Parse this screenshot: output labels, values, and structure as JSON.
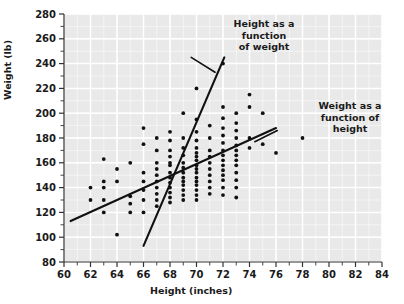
{
  "figure": {
    "background": "#ffffff",
    "plot_bg": "#e9e9e9",
    "grid_color": "#ffffff",
    "point_color": "#111111",
    "line_color": "#111111"
  },
  "axes": {
    "x_label": "Height (inches)",
    "y_label": "Weight (lb)",
    "x_ticks": [
      60,
      62,
      64,
      66,
      68,
      70,
      72,
      74,
      76,
      78,
      80,
      82,
      84
    ],
    "y_ticks": [
      80,
      100,
      120,
      140,
      160,
      180,
      200,
      220,
      240,
      260,
      280
    ],
    "x_minor_step": 1,
    "y_minor_step": 10
  },
  "annotations": [
    {
      "name": "height-as-function-of-weight-label",
      "text": "Height as a\nfunction\nof weight"
    },
    {
      "name": "weight-as-function-of-height-label",
      "text": "Weight as a\nfunction of\nheight"
    }
  ],
  "chart_data": {
    "type": "scatter",
    "title": "",
    "xlabel": "Height (inches)",
    "ylabel": "Weight (lb)",
    "xlim": [
      60,
      84
    ],
    "ylim": [
      80,
      280
    ],
    "xtick_step": 2,
    "ytick_step": 20,
    "grid": true,
    "legend": "none",
    "points": [
      [
        62,
        140
      ],
      [
        62,
        130
      ],
      [
        63,
        163
      ],
      [
        63,
        145
      ],
      [
        63,
        140
      ],
      [
        63,
        130
      ],
      [
        63,
        120
      ],
      [
        64,
        145
      ],
      [
        64,
        155
      ],
      [
        64,
        102
      ],
      [
        65,
        160
      ],
      [
        65,
        133
      ],
      [
        65,
        127
      ],
      [
        65,
        120
      ],
      [
        66,
        175
      ],
      [
        66,
        188
      ],
      [
        66,
        152
      ],
      [
        66,
        145
      ],
      [
        66,
        138
      ],
      [
        66,
        130
      ],
      [
        66,
        120
      ],
      [
        67,
        180
      ],
      [
        67,
        170
      ],
      [
        67,
        160
      ],
      [
        67,
        155
      ],
      [
        67,
        150
      ],
      [
        67,
        145
      ],
      [
        67,
        140
      ],
      [
        67,
        135
      ],
      [
        67,
        130
      ],
      [
        67,
        125
      ],
      [
        68,
        185
      ],
      [
        68,
        178
      ],
      [
        68,
        170
      ],
      [
        68,
        165
      ],
      [
        68,
        160
      ],
      [
        68,
        158
      ],
      [
        68,
        152
      ],
      [
        68,
        148
      ],
      [
        68,
        144
      ],
      [
        68,
        140
      ],
      [
        68,
        136
      ],
      [
        68,
        132
      ],
      [
        68,
        128
      ],
      [
        69,
        200
      ],
      [
        69,
        180
      ],
      [
        69,
        172
      ],
      [
        69,
        166
      ],
      [
        69,
        160
      ],
      [
        69,
        156
      ],
      [
        69,
        152
      ],
      [
        69,
        148
      ],
      [
        69,
        145
      ],
      [
        69,
        142
      ],
      [
        69,
        138
      ],
      [
        69,
        134
      ],
      [
        69,
        130
      ],
      [
        70,
        220
      ],
      [
        70,
        195
      ],
      [
        70,
        185
      ],
      [
        70,
        178
      ],
      [
        70,
        172
      ],
      [
        70,
        168
      ],
      [
        70,
        165
      ],
      [
        70,
        162
      ],
      [
        70,
        158
      ],
      [
        70,
        155
      ],
      [
        70,
        152
      ],
      [
        70,
        148
      ],
      [
        70,
        145
      ],
      [
        70,
        142
      ],
      [
        70,
        138
      ],
      [
        70,
        134
      ],
      [
        70,
        130
      ],
      [
        71,
        190
      ],
      [
        71,
        180
      ],
      [
        71,
        170
      ],
      [
        71,
        165
      ],
      [
        71,
        160
      ],
      [
        71,
        155
      ],
      [
        71,
        150
      ],
      [
        71,
        145
      ],
      [
        71,
        140
      ],
      [
        71,
        135
      ],
      [
        72,
        240
      ],
      [
        72,
        205
      ],
      [
        72,
        196
      ],
      [
        72,
        188
      ],
      [
        72,
        182
      ],
      [
        72,
        176
      ],
      [
        72,
        170
      ],
      [
        72,
        166
      ],
      [
        72,
        162
      ],
      [
        72,
        158
      ],
      [
        72,
        154
      ],
      [
        72,
        150
      ],
      [
        72,
        146
      ],
      [
        72,
        140
      ],
      [
        72,
        134
      ],
      [
        73,
        200
      ],
      [
        73,
        192
      ],
      [
        73,
        186
      ],
      [
        73,
        180
      ],
      [
        73,
        174
      ],
      [
        73,
        170
      ],
      [
        73,
        166
      ],
      [
        73,
        162
      ],
      [
        73,
        158
      ],
      [
        73,
        152
      ],
      [
        73,
        146
      ],
      [
        73,
        140
      ],
      [
        73,
        132
      ],
      [
        74,
        215
      ],
      [
        74,
        205
      ],
      [
        74,
        180
      ],
      [
        74,
        172
      ],
      [
        75,
        200
      ],
      [
        75,
        175
      ],
      [
        76,
        168
      ],
      [
        78,
        180
      ]
    ],
    "trend_lines": [
      {
        "name": "weight-as-function-of-height",
        "label": "Weight as a function of height",
        "x0": 60.5,
        "y0": 113,
        "x1": 76.0,
        "y1": 188
      },
      {
        "name": "height-as-function-of-weight",
        "label": "Height as a function of weight",
        "x0": 66.0,
        "y0": 93,
        "x1": 72.1,
        "y1": 245
      }
    ],
    "annotation_leaders": [
      {
        "name": "leader-height-as-function-of-weight",
        "x0": 71.4,
        "y0": 233,
        "x1": 69.6,
        "y1": 245
      },
      {
        "name": "leader-weight-as-function-of-height",
        "x0": 74.4,
        "y0": 177,
        "x1": 76.1,
        "y1": 186
      }
    ]
  }
}
